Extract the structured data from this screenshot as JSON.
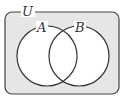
{
  "diagram": {
    "type": "venn",
    "universe_label": "U",
    "sets": [
      {
        "label": "A"
      },
      {
        "label": "B"
      }
    ],
    "colors": {
      "universe_fill": "#e6e6e6",
      "circle_fill": "#ffffff",
      "stroke": "#333333"
    }
  }
}
